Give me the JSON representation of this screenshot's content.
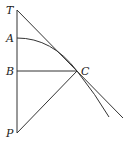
{
  "diagram": {
    "type": "geometry",
    "labels": {
      "T": "T",
      "A": "A",
      "B": "B",
      "C": "C",
      "P": "P"
    },
    "points": {
      "T": [
        17,
        10
      ],
      "A": [
        17,
        38
      ],
      "B": [
        17,
        71
      ],
      "C": [
        77,
        71
      ],
      "P": [
        17,
        133
      ]
    },
    "segments": [
      {
        "name": "TP",
        "from": "T",
        "to": "P"
      },
      {
        "name": "BC",
        "from": "B",
        "to": "C"
      },
      {
        "name": "PC",
        "from": "P",
        "to": "C"
      },
      {
        "name": "tangent-TC",
        "from": "T",
        "through": "C",
        "extends_to": [
          123,
          118
        ]
      }
    ],
    "curves": [
      {
        "name": "arc-AC",
        "from": "A",
        "through": "C",
        "extends_to": [
          109,
          117
        ]
      }
    ],
    "colors": {
      "stroke": "#333333",
      "background": "#ffffff"
    }
  }
}
